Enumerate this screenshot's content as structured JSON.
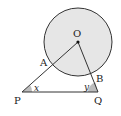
{
  "diagram": {
    "type": "geometry",
    "circle": {
      "center_label": "O",
      "fill": "#e6e6e6",
      "stroke": "#333333"
    },
    "points": {
      "O": "O",
      "A": "A",
      "B": "B",
      "P": "P",
      "Q": "Q"
    },
    "angles": {
      "at_P": "x",
      "at_Q": "y",
      "shade": "#bdbdbd"
    },
    "segments": [
      "PO",
      "QO",
      "PQ"
    ]
  }
}
